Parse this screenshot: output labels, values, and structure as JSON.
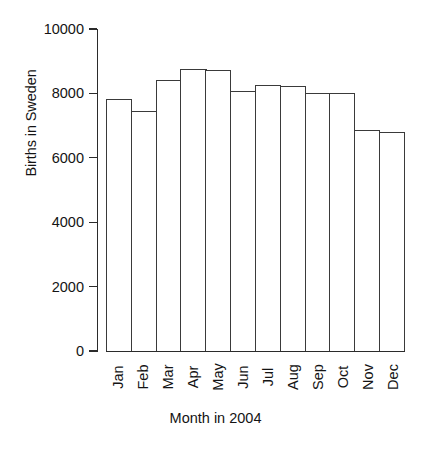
{
  "chart_data": {
    "type": "bar",
    "title": "",
    "xlabel": "Month in 2004",
    "ylabel": "Births in Sweden",
    "categories": [
      "Jan",
      "Feb",
      "Mar",
      "Apr",
      "May",
      "Jun",
      "Jul",
      "Aug",
      "Sep",
      "Oct",
      "Nov",
      "Dec"
    ],
    "values": [
      7850,
      7500,
      8450,
      8800,
      8750,
      8100,
      8300,
      8250,
      8030,
      8050,
      6880,
      6840
    ],
    "ylim": [
      0,
      10000
    ],
    "yticks": [
      0,
      2000,
      4000,
      6000,
      8000,
      10000
    ],
    "ytick_labels": [
      "0",
      "2000",
      "4000",
      "6000",
      "8000",
      "10000"
    ],
    "grid": false,
    "legend": false,
    "bar_fill_color": "#ffffff",
    "bar_edge_color": "#3a3a3a",
    "axis_color": "#2b2b2b",
    "text_color": "#141414",
    "background_color": "#ffffff"
  }
}
